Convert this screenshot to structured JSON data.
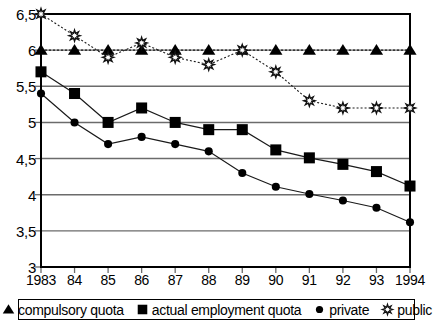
{
  "chart_data": {
    "type": "line",
    "title": "",
    "xlabel": "",
    "ylabel": "",
    "grid": true,
    "legend_position": "bottom",
    "x": [
      1983,
      1984,
      1985,
      1986,
      1987,
      1988,
      1989,
      1990,
      1991,
      1992,
      1993,
      1994
    ],
    "categories": [
      "1983",
      "84",
      "85",
      "86",
      "87",
      "88",
      "89",
      "90",
      "91",
      "92",
      "93",
      "1994"
    ],
    "ylim": [
      3,
      6.5
    ],
    "yticks": [
      3,
      3.5,
      4,
      4.5,
      5,
      5.5,
      6,
      6.5
    ],
    "ytick_labels": [
      "3",
      "3,5",
      "4",
      "4,5",
      "5",
      "5,5",
      "6",
      "6,5"
    ],
    "series": [
      {
        "name": "compulsory quota",
        "marker": "triangle-filled",
        "color": "#000000",
        "linestyle": "dotted",
        "values": [
          6,
          6,
          6,
          6,
          6,
          6,
          6,
          6,
          6,
          6,
          6,
          6
        ]
      },
      {
        "name": "actual employment quota",
        "marker": "square-filled",
        "color": "#000000",
        "linestyle": "solid",
        "values": [
          5.7,
          5.4,
          5.0,
          5.2,
          5.0,
          4.9,
          4.9,
          4.62,
          4.51,
          4.42,
          4.32,
          4.12
        ]
      },
      {
        "name": "private",
        "marker": "circle-filled",
        "color": "#000000",
        "linestyle": "solid",
        "values": [
          5.4,
          5.0,
          4.7,
          4.8,
          4.7,
          4.6,
          4.3,
          4.11,
          4.01,
          3.92,
          3.82,
          3.62
        ]
      },
      {
        "name": "public",
        "marker": "starburst-open",
        "color": "#000000",
        "linestyle": "dotted",
        "values": [
          6.5,
          6.2,
          5.9,
          6.1,
          5.9,
          5.8,
          6.0,
          5.7,
          5.3,
          5.2,
          5.2,
          5.2
        ]
      }
    ]
  },
  "legend": {
    "items": [
      {
        "label": "compulsory quota",
        "marker": "triangle-filled"
      },
      {
        "label": "actual employment quota",
        "marker": "square-filled"
      },
      {
        "label": "private",
        "marker": "circle-filled"
      },
      {
        "label": "public",
        "marker": "starburst-open"
      }
    ]
  }
}
